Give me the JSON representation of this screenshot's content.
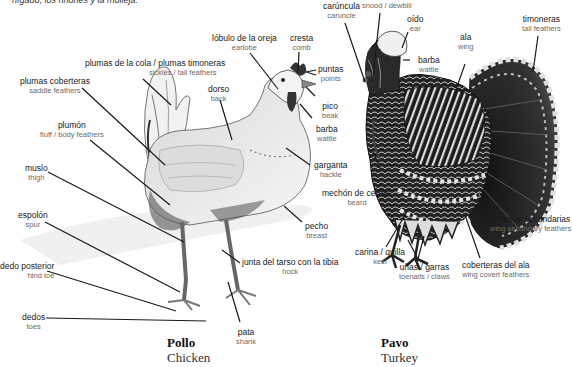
{
  "caption_fragment": "hígado, los riñones y la molleja.",
  "chicken": {
    "title_es": "Pollo",
    "title_en": "Chicken",
    "labels": [
      {
        "id": "tail",
        "es": "plumas de la cola / plumas timoneras",
        "en": "sickles / tail feathers"
      },
      {
        "id": "saddle",
        "es": "plumas coberteras",
        "en": "saddle feathers"
      },
      {
        "id": "fluff",
        "es": "plumón",
        "en": "fluff / body feathers"
      },
      {
        "id": "thigh",
        "es": "muslo",
        "en": "thigh"
      },
      {
        "id": "spur",
        "es": "espolón",
        "en": "spur"
      },
      {
        "id": "hindtoe",
        "es": "dedo posterior",
        "en": "hind toe"
      },
      {
        "id": "toes",
        "es": "dedos",
        "en": "toes"
      },
      {
        "id": "earlobe",
        "es": "lóbulo de la oreja",
        "en": "earlobe"
      },
      {
        "id": "comb",
        "es": "cresta",
        "en": "comb"
      },
      {
        "id": "points",
        "es": "puntas",
        "en": "points"
      },
      {
        "id": "back",
        "es": "dorso",
        "en": "back"
      },
      {
        "id": "beak",
        "es": "pico",
        "en": "beak"
      },
      {
        "id": "wattle",
        "es": "barba",
        "en": "wattle"
      },
      {
        "id": "hackle",
        "es": "garganta",
        "en": "hackle"
      },
      {
        "id": "breast",
        "es": "pecho",
        "en": "breast"
      },
      {
        "id": "hock",
        "es": "junta del tarso con la tibia",
        "en": "hock"
      },
      {
        "id": "shank",
        "es": "pata",
        "en": "shank"
      }
    ]
  },
  "turkey": {
    "title_es": "Pavo",
    "title_en": "Turkey",
    "labels": [
      {
        "id": "caruncle",
        "es": "carúncula",
        "en": "caruncle"
      },
      {
        "id": "snood",
        "es": "moco",
        "en": "snood / dewbill"
      },
      {
        "id": "ear",
        "es": "oído",
        "en": "ear"
      },
      {
        "id": "wattle",
        "es": "barba",
        "en": "wattle"
      },
      {
        "id": "wing",
        "es": "ala",
        "en": "wing"
      },
      {
        "id": "tail",
        "es": "timoneras",
        "en": "tail feathers"
      },
      {
        "id": "beard",
        "es": "mechón de cerdas",
        "en": "beard"
      },
      {
        "id": "keel",
        "es": "carina / quilla",
        "en": "keel"
      },
      {
        "id": "toenails",
        "es": "uñas / garras",
        "en": "toenails / claws"
      },
      {
        "id": "secondary",
        "es": "remeras secundarias",
        "en": "wing secondary feathers"
      },
      {
        "id": "covert",
        "es": "coberteras del ala",
        "en": "wing covert feathers"
      }
    ]
  },
  "colors": {
    "leader_line": "#1a1a1a",
    "label_es": "#1a1a1a",
    "label_en": "#6a6a6a",
    "turkey_dark": "#1c1c1c",
    "turkey_light": "#e8e8e8",
    "chicken_shade": "#9a9a9a"
  }
}
